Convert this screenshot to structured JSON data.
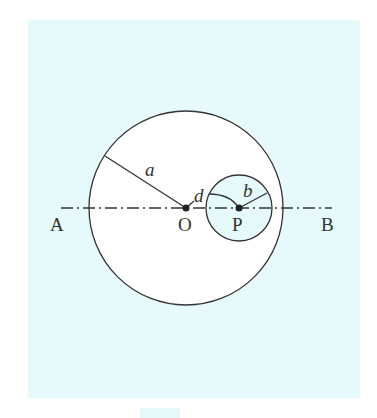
{
  "colors": {
    "panel": "#e6fafc",
    "circle_fill": "#ffffff",
    "small_circle_fill": "#e6fafc",
    "stroke": "#333333"
  },
  "labels": {
    "A": "A",
    "B": "B",
    "O": "O",
    "P": "P",
    "a": "a",
    "b": "b",
    "d": "d"
  },
  "geometry": {
    "large_circle": {
      "cx": 186,
      "cy": 208,
      "r": 97
    },
    "small_circle": {
      "cx": 239,
      "cy": 208,
      "r": 33
    },
    "axis": {
      "x1": 61,
      "x2": 332,
      "y": 208
    }
  }
}
